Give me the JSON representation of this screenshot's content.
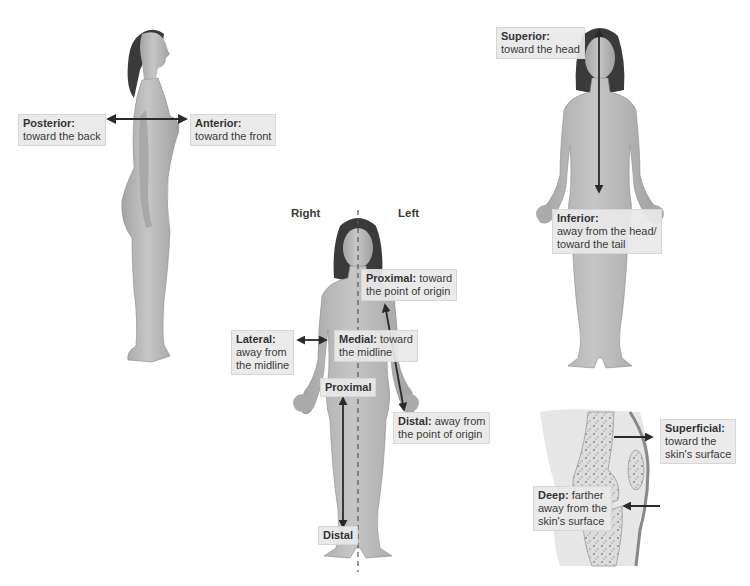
{
  "colors": {
    "skin": "#b8b8b8",
    "skin_shade": "#9a9a9a",
    "hair": "#3a3a3a",
    "arrow": "#2a2a2a",
    "label_bg": "#e8e8e8",
    "text": "#3a3a3a"
  },
  "lateral_view": {
    "posterior": {
      "term": "Posterior:",
      "desc": "toward the back"
    },
    "anterior": {
      "term": "Anterior:",
      "desc": "toward the front"
    }
  },
  "anterior_view_center": {
    "side_right": "Right",
    "side_left": "Left",
    "proximal_upper": {
      "term": "Proximal:",
      "desc_line1": "toward",
      "desc_line2": "the point of origin"
    },
    "lateral": {
      "term": "Lateral:",
      "desc_line1": "away from",
      "desc_line2": "the midline"
    },
    "medial": {
      "term": "Medial:",
      "desc_line1": "toward",
      "desc_line2": "the midline"
    },
    "proximal_leg": {
      "term": "Proximal"
    },
    "distal_arm": {
      "term": "Distal:",
      "desc_line1": "away from",
      "desc_line2": "the point of origin"
    },
    "distal_leg": {
      "term": "Distal"
    }
  },
  "anterior_view_right": {
    "superior": {
      "term": "Superior:",
      "desc": "toward the head"
    },
    "inferior": {
      "term": "Inferior:",
      "desc_line1": "away from the head/",
      "desc_line2": "toward the tail"
    }
  },
  "knee_section": {
    "superficial": {
      "term": "Superficial:",
      "desc_line1": "toward the",
      "desc_line2": "skin's surface"
    },
    "deep": {
      "term": "Deep:",
      "desc_line1": "farther",
      "desc_line2": "away from the",
      "desc_line3": "skin's surface"
    }
  }
}
